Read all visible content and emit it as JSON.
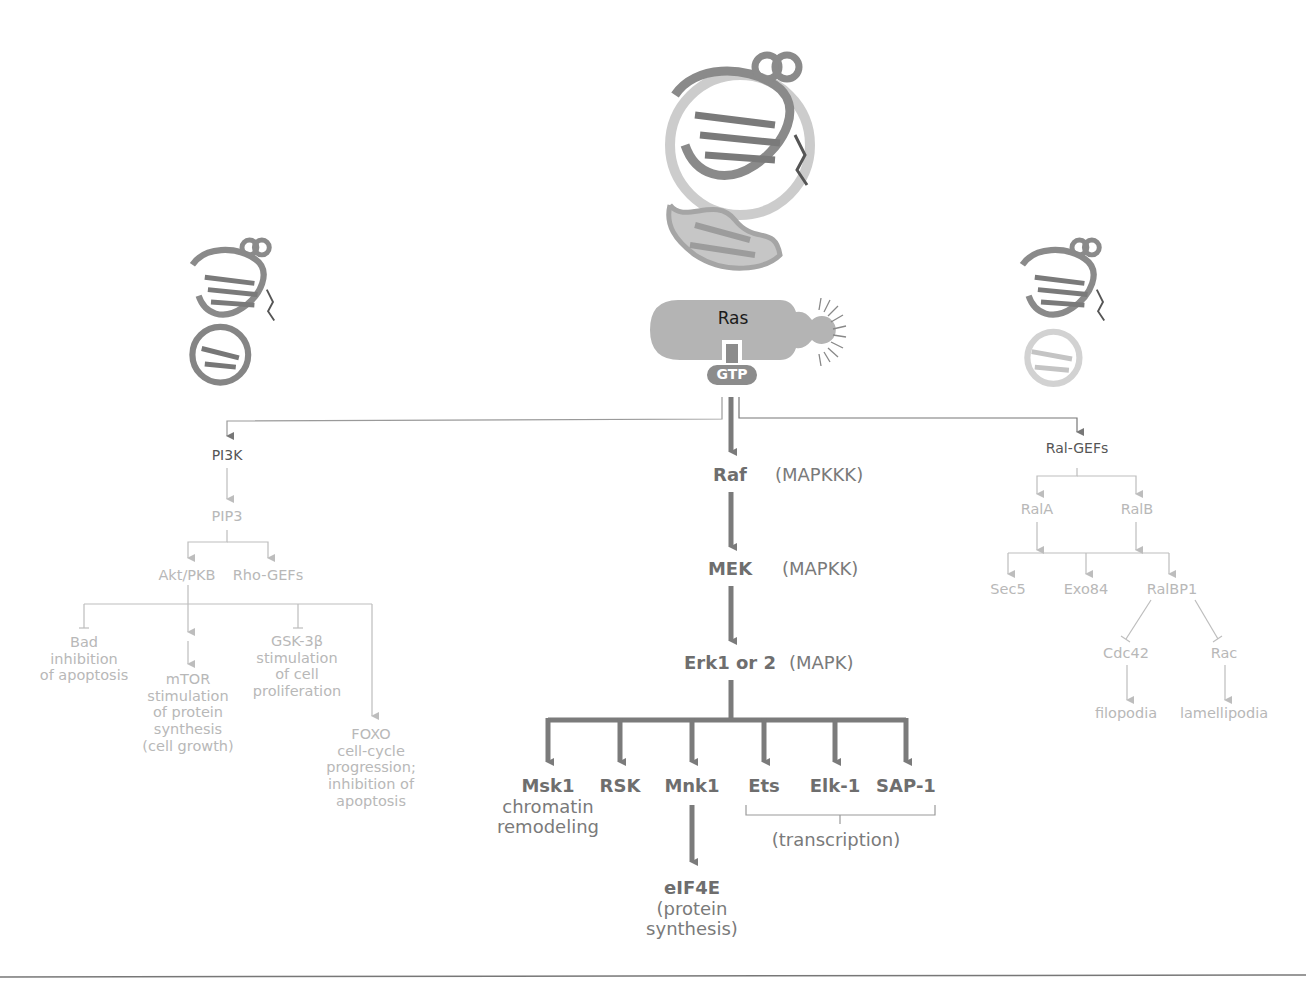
{
  "figure": {
    "central": {
      "protein": "Ras",
      "nucleotide": "GTP"
    },
    "structures": [
      {
        "id": "ras-structure-center",
        "icon": "protein-ribbon-structure"
      },
      {
        "id": "ras-structure-left",
        "icon": "protein-ribbon-structure"
      },
      {
        "id": "ras-structure-right",
        "icon": "protein-ribbon-structure"
      }
    ],
    "left_branch": {
      "root": "PI3K",
      "second": "PIP3",
      "effectors": [
        "Akt/PKB",
        "Rho-GEFs"
      ],
      "targets": [
        {
          "name": "Bad",
          "effect_lines": [
            "inhibition",
            "of apoptosis"
          ],
          "arrow": "inhibit"
        },
        {
          "name": "mTOR",
          "effect_lines": [
            "stimulation",
            "of protein",
            "synthesis",
            "(cell growth)"
          ],
          "arrow": "activate"
        },
        {
          "name": "GSK-3β",
          "effect_lines": [
            "stimulation",
            "of cell",
            "proliferation"
          ],
          "arrow": "inhibit"
        },
        {
          "name": "FOXO",
          "effect_lines": [
            "cell-cycle",
            "progression;",
            "inhibition of",
            "apoptosis"
          ],
          "arrow": "activate"
        }
      ]
    },
    "center_branch": {
      "cascade": [
        {
          "name": "Raf",
          "class": "(MAPKKK)"
        },
        {
          "name": "MEK",
          "class": "(MAPKK)"
        },
        {
          "name": "Erk1 or 2",
          "class": "(MAPK)"
        }
      ],
      "targets": [
        {
          "name": "Msk1",
          "effect_lines": [
            "chromatin",
            "remodeling"
          ]
        },
        {
          "name": "RSK"
        },
        {
          "name": "Mnk1"
        },
        {
          "name": "Ets"
        },
        {
          "name": "Elk-1"
        },
        {
          "name": "SAP-1"
        }
      ],
      "mnk1_downstream": {
        "name": "eIF4E",
        "effect_lines": [
          "(protein",
          "synthesis)"
        ]
      },
      "transcription_group_label": "(transcription)"
    },
    "right_branch": {
      "root": "Ral-GEFs",
      "second": [
        "RalA",
        "RalB"
      ],
      "third": [
        "Sec5",
        "Exo84",
        "RalBP1"
      ],
      "fourth": [
        {
          "name": "Cdc42",
          "outcome": "filopodia",
          "arrow": "inhibit"
        },
        {
          "name": "Rac",
          "outcome": "lamellipodia",
          "arrow": "inhibit"
        }
      ]
    },
    "colors": {
      "ras_body": "#b4b4b4",
      "gtp_badge": "#8c8c8c",
      "main_arrow": "#7b7b7b",
      "faint_arrow": "#bdbdbd",
      "dark_text": "#555555",
      "faint_text": "#b8b8b8",
      "rule_line": "#777777"
    }
  }
}
